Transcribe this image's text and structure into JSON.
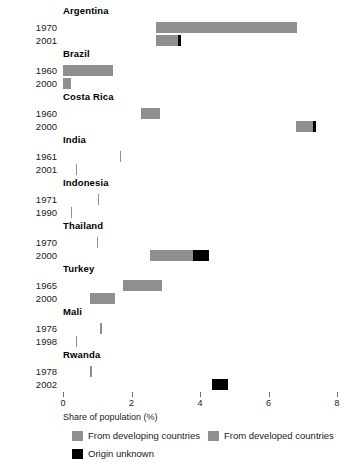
{
  "chart_data": {
    "type": "bar",
    "title": "",
    "subtitle": "",
    "xlabel": "Share of population (%)",
    "ylabel": "",
    "xlim": [
      0,
      8
    ],
    "xticks": [
      0,
      2,
      4,
      6,
      8
    ],
    "xtick_labels": [
      "0",
      "2",
      "4",
      "6",
      "8"
    ],
    "grid": false,
    "orientation": "horizontal",
    "stacked": true,
    "legend_position": "bottom",
    "series": [
      {
        "name": "From developing countries",
        "key": "developing",
        "color": "#8f8f8f"
      },
      {
        "name": "From developed countries",
        "key": "developed",
        "color": "#8f8f8f"
      },
      {
        "name": "Origin unknown",
        "key": "unknown",
        "color": "#000000"
      }
    ],
    "groups": [
      {
        "country": "Argentina",
        "rows": [
          {
            "year": "1970",
            "start": 2.72,
            "developing": 0.0,
            "developed": 4.1,
            "unknown": 0.0,
            "total": 6.82
          },
          {
            "year": "2001",
            "start": 2.72,
            "developing": 0.64,
            "developed": 0.0,
            "unknown": 0.09,
            "total": 3.45
          }
        ]
      },
      {
        "country": "Brazil",
        "rows": [
          {
            "year": "1960",
            "start": 0.0,
            "developing": 0.0,
            "developed": 1.46,
            "unknown": 0.0,
            "total": 1.46
          },
          {
            "year": "2000",
            "start": 0.0,
            "developing": 0.23,
            "developed": 0.0,
            "unknown": 0.0,
            "total": 0.23
          }
        ]
      },
      {
        "country": "Costa Rica",
        "rows": [
          {
            "year": "1960",
            "start": 2.28,
            "developing": 0.55,
            "developed": 0.0,
            "unknown": 0.0,
            "total": 2.83
          },
          {
            "year": "2000",
            "start": 6.8,
            "developing": 0.5,
            "developed": 0.0,
            "unknown": 0.09,
            "total": 7.39
          }
        ]
      },
      {
        "country": "India",
        "rows": [
          {
            "year": "1961",
            "start": 1.66,
            "developing": 0.04,
            "developed": 0.0,
            "unknown": 0.0,
            "total": 1.7
          },
          {
            "year": "2001",
            "start": 0.38,
            "developing": 0.04,
            "developed": 0.0,
            "unknown": 0.0,
            "total": 0.42
          }
        ]
      },
      {
        "country": "Indonesia",
        "rows": [
          {
            "year": "1971",
            "start": 1.01,
            "developing": 0.04,
            "developed": 0.0,
            "unknown": 0.0,
            "total": 1.05
          },
          {
            "year": "1990",
            "start": 0.23,
            "developing": 0.04,
            "developed": 0.0,
            "unknown": 0.0,
            "total": 0.27
          }
        ]
      },
      {
        "country": "Thailand",
        "rows": [
          {
            "year": "1970",
            "start": 0.99,
            "developing": 0.04,
            "developed": 0.0,
            "unknown": 0.0,
            "total": 1.03
          },
          {
            "year": "2000",
            "start": 2.54,
            "developing": 1.26,
            "developed": 0.0,
            "unknown": 0.46,
            "total": 4.26
          }
        ]
      },
      {
        "country": "Turkey",
        "rows": [
          {
            "year": "1965",
            "start": 1.75,
            "developing": 1.15,
            "developed": 0.0,
            "unknown": 0.0,
            "total": 2.9
          },
          {
            "year": "2000",
            "start": 0.79,
            "developing": 0.73,
            "developed": 0.0,
            "unknown": 0.0,
            "total": 1.52
          }
        ]
      },
      {
        "country": "Mali",
        "rows": [
          {
            "year": "1976",
            "start": 1.08,
            "developing": 0.06,
            "developed": 0.0,
            "unknown": 0.0,
            "total": 1.14
          },
          {
            "year": "1998",
            "start": 0.38,
            "developing": 0.04,
            "developed": 0.0,
            "unknown": 0.0,
            "total": 0.42
          }
        ]
      },
      {
        "country": "Rwanda",
        "rows": [
          {
            "year": "1978",
            "start": 0.79,
            "developing": 0.06,
            "developed": 0.0,
            "unknown": 0.0,
            "total": 0.85
          },
          {
            "year": "2002",
            "start": 4.35,
            "developing": 0.0,
            "developed": 0.0,
            "unknown": 0.47,
            "total": 4.82
          }
        ]
      }
    ]
  },
  "axis": {
    "title": "Share of population (%)",
    "ticks": [
      "0",
      "2",
      "4",
      "6",
      "8"
    ]
  },
  "legend": {
    "items": [
      {
        "label": "From developing countries",
        "kind": "developing"
      },
      {
        "label": "From developed countries",
        "kind": "developed"
      },
      {
        "label": "Origin unknown",
        "kind": "unknown"
      }
    ]
  }
}
